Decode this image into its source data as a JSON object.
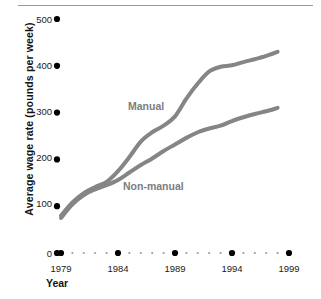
{
  "chart_data": {
    "type": "line",
    "title": "",
    "subtitle": "",
    "xlabel": "Year",
    "ylabel": "Average wage rate (pounds per week)",
    "xlim": [
      1979,
      1999
    ],
    "ylim": [
      0,
      500
    ],
    "xticks": [
      1979,
      1984,
      1989,
      1994,
      1999
    ],
    "xtick_labels": [
      "1979",
      "1984",
      "1989",
      "1994",
      "1999"
    ],
    "yticks": [
      0,
      100,
      200,
      300,
      400,
      500
    ],
    "ytick_labels": [
      "0",
      "100",
      "200",
      "300",
      "400",
      "500"
    ],
    "grid": false,
    "legend_position": "inline-annotation",
    "axis_style": "dotted-markers",
    "line_color": "#858585",
    "line_width": 4,
    "series": [
      {
        "name": "Manual",
        "label": "Manual",
        "color": "#858585",
        "x": [
          1979,
          1980,
          1981,
          1982,
          1983,
          1984,
          1985,
          1986,
          1987,
          1988,
          1989,
          1990,
          1991,
          1992,
          1993,
          1994,
          1995,
          1996,
          1997,
          1998
        ],
        "values": [
          80,
          108,
          128,
          141,
          152,
          175,
          205,
          238,
          258,
          272,
          292,
          330,
          362,
          388,
          398,
          401,
          408,
          414,
          421,
          430
        ]
      },
      {
        "name": "Non-manual",
        "label": "Non-manual",
        "color": "#858585",
        "x": [
          1979,
          1980,
          1981,
          1982,
          1983,
          1984,
          1985,
          1986,
          1987,
          1988,
          1989,
          1990,
          1991,
          1992,
          1993,
          1994,
          1995,
          1996,
          1997,
          1998
        ],
        "values": [
          75,
          104,
          124,
          136,
          145,
          156,
          172,
          188,
          202,
          218,
          232,
          246,
          258,
          266,
          272,
          282,
          290,
          297,
          303,
          310
        ]
      }
    ],
    "annotations": [
      {
        "text": "Manual",
        "x": 1985,
        "y": 330
      },
      {
        "text": "Non-manual",
        "x": 1984.5,
        "y": 155
      }
    ]
  },
  "axis": {
    "y_title": "Average wage rate (pounds per week)",
    "x_title": "Year"
  }
}
